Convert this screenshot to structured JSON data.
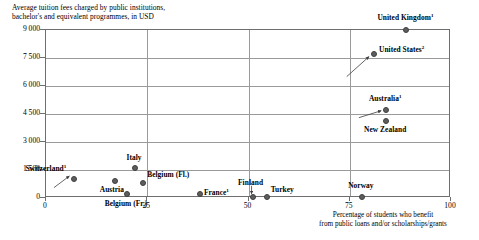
{
  "chart_data": {
    "type": "scatter",
    "title": "Average tuition fees charged by public institutions, bachelor's and equivalent programmes, in USD",
    "title_line1": "Average tuition fees charged by public institutions,",
    "title_line2": "bachelor's and equivalent programmes, in USD",
    "xlabel": "Percentage of students who benefit from public loans and/or scholarships/grants",
    "xlabel_line1": "Percentage of students who benefit",
    "xlabel_line2": "from public loans and/or scholarships/grants",
    "ylabel": "",
    "xlim": [
      0,
      100
    ],
    "ylim": [
      0,
      9000
    ],
    "xticks": [
      "0",
      "25",
      "50",
      "75",
      "100"
    ],
    "xtick_values": [
      0,
      25,
      50,
      75,
      100
    ],
    "yticks": [
      "0",
      "1 500",
      "3 000",
      "4 500",
      "6 000",
      "7 500",
      "9 000"
    ],
    "ytick_values": [
      0,
      1500,
      3000,
      4500,
      6000,
      7500,
      9000
    ],
    "grid": true,
    "legend": "none",
    "marker_color": "#5d5d5d",
    "grid_color": "#9a9a9a",
    "frame_color": "#6e6e6e",
    "points": [
      {
        "name": "United Kingdom",
        "footnote": "1",
        "x": 89.0,
        "y": 9000,
        "label_dx": 0,
        "label_dy": -11,
        "anchor": "mid"
      },
      {
        "name": "United States",
        "footnote": "2",
        "x": 81.0,
        "y": 7700,
        "label_dx": 6,
        "label_dy": -3,
        "anchor": "start"
      },
      {
        "name": "Australia",
        "footnote": "1",
        "x": 84.0,
        "y": 4700,
        "label_dx": 0,
        "label_dy": -10,
        "anchor": "mid"
      },
      {
        "name": "New Zealand",
        "footnote": "",
        "x": 84.0,
        "y": 4100,
        "label_dx": 0,
        "label_dy": 10,
        "anchor": "mid"
      },
      {
        "name": "Italy",
        "footnote": "",
        "x": 22.0,
        "y": 1600,
        "label_dx": 0,
        "label_dy": -9,
        "anchor": "mid"
      },
      {
        "name": "Switzerland",
        "footnote": "1",
        "x": 7.0,
        "y": 1000,
        "label_dx": -7,
        "label_dy": -9,
        "anchor": "end"
      },
      {
        "name": "Austria",
        "footnote": "",
        "x": 17.0,
        "y": 900,
        "label_dx": -2,
        "label_dy": 10,
        "anchor": "mid"
      },
      {
        "name": "Belgium (Fl.)",
        "footnote": "",
        "x": 24.0,
        "y": 800,
        "label_dx": 5,
        "label_dy": -7,
        "anchor": "start"
      },
      {
        "name": "Belgium (Fr.)",
        "footnote": "",
        "x": 20.0,
        "y": 200,
        "label_dx": 0,
        "label_dy": 11,
        "anchor": "mid"
      },
      {
        "name": "France",
        "footnote": "1",
        "x": 38.0,
        "y": 200,
        "label_dx": 5,
        "label_dy": 0,
        "anchor": "start"
      },
      {
        "name": "Finland",
        "footnote": "",
        "x": 51.0,
        "y": 60,
        "label_dx": -1,
        "label_dy": -13,
        "anchor": "mid"
      },
      {
        "name": "Turkey",
        "footnote": "",
        "x": 54.5,
        "y": 60,
        "label_dx": 5,
        "label_dy": -6,
        "anchor": "start"
      },
      {
        "name": "Norway",
        "footnote": "",
        "x": 78.0,
        "y": 60,
        "label_dx": 0,
        "label_dy": -10,
        "anchor": "mid"
      }
    ],
    "leader_lines": [
      {
        "target": "United States",
        "x1": 74.5,
        "y1": 6450,
        "x2": 80.0,
        "y2": 7520
      },
      {
        "target": "Switzerland",
        "x1": 2.2,
        "y1": 500,
        "x2": 6.0,
        "y2": 1120
      },
      {
        "target": "Australia",
        "x1": 77.5,
        "y1": 4250,
        "x2": 83.0,
        "y2": 4620
      },
      {
        "target": "Finland",
        "x1": 51.0,
        "y1": 600,
        "x2": 51.0,
        "y2": 170
      }
    ]
  }
}
